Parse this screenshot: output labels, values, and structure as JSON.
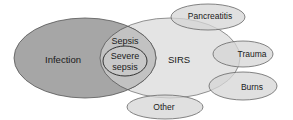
{
  "diagram": {
    "type": "venn",
    "colors": {
      "infection_fill": "#a6a6a6",
      "sirs_fill": "#e4e4e4",
      "overlap_fill": "#c2c2c2",
      "small_fill": "#d6d6d6",
      "stroke": "#555555"
    },
    "sets": {
      "infection": {
        "label": "Infection"
      },
      "sirs": {
        "label": "SIRS"
      },
      "sepsis": {
        "label": "Sepsis"
      },
      "severe_sepsis": {
        "line1": "Severe",
        "line2": "sepsis"
      },
      "pancreatitis": {
        "label": "Pancreatitis"
      },
      "trauma": {
        "label": "Trauma"
      },
      "burns": {
        "label": "Burns"
      },
      "other": {
        "label": "Other"
      }
    }
  }
}
